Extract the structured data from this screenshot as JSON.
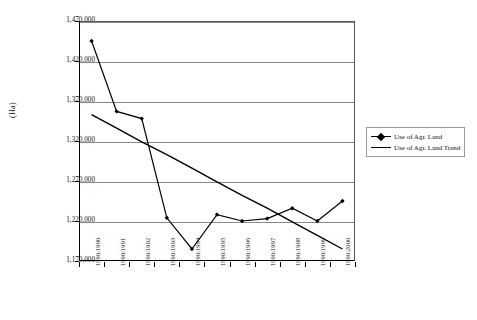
{
  "chart_data": {
    "type": "line",
    "title": "",
    "xlabel": "",
    "ylabel": "(Ha)",
    "ylim": [
      1170000,
      1470000
    ],
    "ytick_step": 50000,
    "grid": true,
    "legend_position": "right",
    "categories": [
      "1990:1990",
      "1990:1991",
      "1990:1992",
      "1990:1993",
      "1990:1994",
      "1990:1995",
      "1990:1996",
      "1990:1997",
      "1990:1998",
      "1990:1999",
      "1990:2000"
    ],
    "ytick_labels": [
      "1,470,000",
      "1,420,000",
      "1,370,000",
      "1,320,000",
      "1,270,000",
      "1,220,000",
      "1,170,000"
    ],
    "ytick_values": [
      1470000,
      1420000,
      1370000,
      1320000,
      1270000,
      1220000,
      1170000
    ],
    "series": [
      {
        "name": "Use of Agr. Land",
        "marker": "diamond",
        "values": [
          1445000,
          1357000,
          1348000,
          1224000,
          1185000,
          1228000,
          1220000,
          1223000,
          1236000,
          1220000,
          1245000
        ]
      },
      {
        "name": "Use of Agr. Land Trend",
        "marker": "none",
        "values": [
          1353000,
          1336000,
          1319000,
          1303000,
          1286000,
          1269000,
          1252000,
          1236000,
          1219000,
          1202000,
          1185000
        ]
      }
    ]
  },
  "legend": {
    "items": [
      {
        "label": "Use of Agr. Land",
        "key": "marker-line"
      },
      {
        "label": "Use of Agr. Land Trend",
        "key": "line"
      }
    ]
  }
}
